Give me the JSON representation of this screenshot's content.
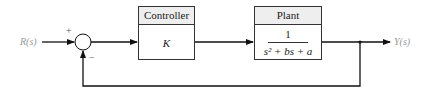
{
  "diagram": {
    "type": "closed-loop feedback block diagram",
    "input": {
      "label": "R(s)"
    },
    "output": {
      "label": "Y(s)"
    },
    "summing_junction": {
      "signs": {
        "reference": "+",
        "feedback": "−"
      }
    },
    "blocks": [
      {
        "id": "controller",
        "title": "Controller",
        "content": "K"
      },
      {
        "id": "plant",
        "title": "Plant",
        "numerator": "1",
        "denominator": "s² + bs + a"
      }
    ],
    "feedback": "unity negative feedback",
    "colors": {
      "line": "#111111",
      "header": "#eeeeee",
      "label": "#9a9a9a"
    }
  }
}
